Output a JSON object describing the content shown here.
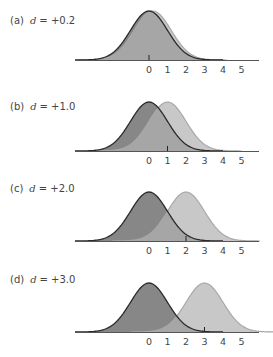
{
  "chart_data": {
    "type": "area",
    "title": "",
    "colors": {
      "reference_fill": "#878787",
      "reference_stroke": "#2a2a2a",
      "shifted_fill": "#c8c8c8",
      "shifted_stroke": "#a8a8a8",
      "overlap_fill": "#a6a6a6",
      "axis": "#555555",
      "text": "#444444"
    },
    "x_ticks": [
      "0",
      "1",
      "2",
      "3",
      "4",
      "5"
    ],
    "xlim": [
      -4,
      5.9
    ],
    "distribution": "normal",
    "sd": 1,
    "panels": [
      {
        "id": "a",
        "label_prefix": "(a)",
        "symbol": "d",
        "label_value": "= +0.2",
        "reference_mean": 0,
        "shifted_mean": 0.2,
        "marker_at": 0
      },
      {
        "id": "b",
        "label_prefix": "(b)",
        "symbol": "d",
        "label_value": "= +1.0",
        "reference_mean": 0,
        "shifted_mean": 1.0,
        "marker_at": 1
      },
      {
        "id": "c",
        "label_prefix": "(c)",
        "symbol": "d",
        "label_value": "= +2.0",
        "reference_mean": 0,
        "shifted_mean": 2.0,
        "marker_at": 2
      },
      {
        "id": "d",
        "label_prefix": "(d)",
        "symbol": "d",
        "label_value": "= +3.0",
        "reference_mean": 0,
        "shifted_mean": 3.0,
        "marker_at": 3
      }
    ]
  }
}
